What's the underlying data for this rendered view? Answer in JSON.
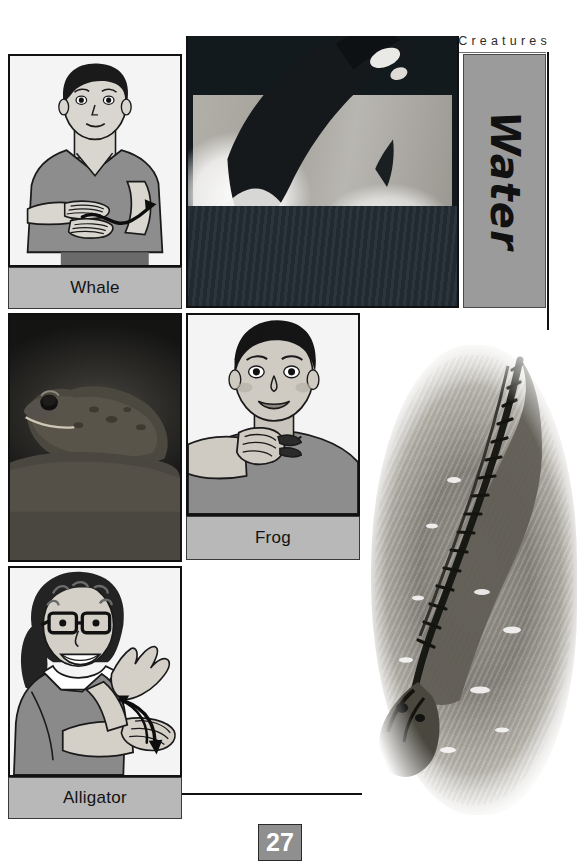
{
  "page": {
    "running_head": "Pets, Animals & Creatures",
    "page_number": "27",
    "side_tab_label": "Water"
  },
  "entries": [
    {
      "id": "whale",
      "label": "Whale",
      "illustration": "sign-language-illustration-whale",
      "illustration_alt": "Person in gray v-neck shirt moving one flat hand in a wavy path over the other forearm",
      "photo": "photo-orca-whale-breaching",
      "photo_alt": "Black and white photograph of an orca whale leaping out of the water"
    },
    {
      "id": "frog",
      "label": "Frog",
      "illustration": "sign-language-illustration-frog",
      "illustration_alt": "Boy making the frog sign with a fist under his chin",
      "photo": "photo-frog-on-rock",
      "photo_alt": "Dark photograph of a frog sitting on a rock facing left"
    },
    {
      "id": "alligator",
      "label": "Alligator",
      "illustration": "sign-language-illustration-alligator",
      "illustration_alt": "Woman with glasses opening both hands like jaws with motion arrows",
      "photo": "photo-alligator-in-water",
      "photo_alt": "Aerial black and white photograph of an alligator floating in water"
    }
  ],
  "icons": {
    "motion_arrow_wavy": "wavy-motion-arrow-icon",
    "motion_arrow_curved": "curved-motion-arrow-icon"
  },
  "colors": {
    "label_bg": "#b8b8b8",
    "tab_bg": "#9b9b9b",
    "pagenum_bg": "#8f8f8f",
    "border": "#111111",
    "skin": "#d9d6d0",
    "shirt": "#8d8d8d",
    "hair": "#1a1a1a"
  }
}
